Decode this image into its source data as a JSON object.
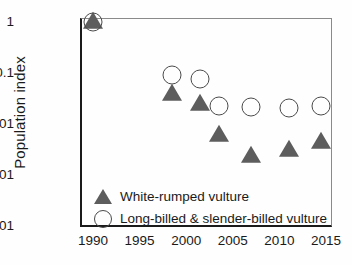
{
  "chart_data": {
    "type": "scatter",
    "title": "",
    "xlabel": "",
    "ylabel": "Population index",
    "xlim": [
      1988.5,
      2016.5
    ],
    "ylim": [
      0.0001,
      1
    ],
    "yscale": "log",
    "grid": false,
    "legend_position": "inside-bottom-left",
    "xticks": [
      "1990",
      "1995",
      "2000",
      "2005",
      "2010",
      "2015"
    ],
    "xtick_values": [
      1990,
      1995,
      2000,
      2005,
      2010,
      2015
    ],
    "yticks": [
      "1",
      "0.1",
      "0.01",
      "0.001",
      "0.0001"
    ],
    "ytick_values": [
      1,
      0.1,
      0.01,
      0.001,
      0.0001
    ],
    "series": [
      {
        "name": "White-rumped vulture",
        "marker": "filled-triangle",
        "color": "#5d5d5d",
        "x": [
          1990,
          1998.5,
          2001.5,
          2003.5,
          2007,
          2011,
          2014.5
        ],
        "values": [
          1,
          0.038,
          0.025,
          0.0061,
          0.0024,
          0.0031,
          0.0044
        ]
      },
      {
        "name": "Long-billed & slender-billed vulture",
        "marker": "open-circle",
        "color": "#4a4a4a",
        "x": [
          1990,
          1998.5,
          2001.5,
          2003.5,
          2007,
          2011,
          2014.5
        ],
        "values": [
          1,
          0.09,
          0.075,
          0.023,
          0.022,
          0.021,
          0.023
        ]
      }
    ]
  },
  "legend": {
    "entries": [
      {
        "label": "White-rumped vulture",
        "marker": "filled-triangle"
      },
      {
        "label": "Long-billed & slender-billed vulture",
        "marker": "open-circle"
      }
    ]
  }
}
